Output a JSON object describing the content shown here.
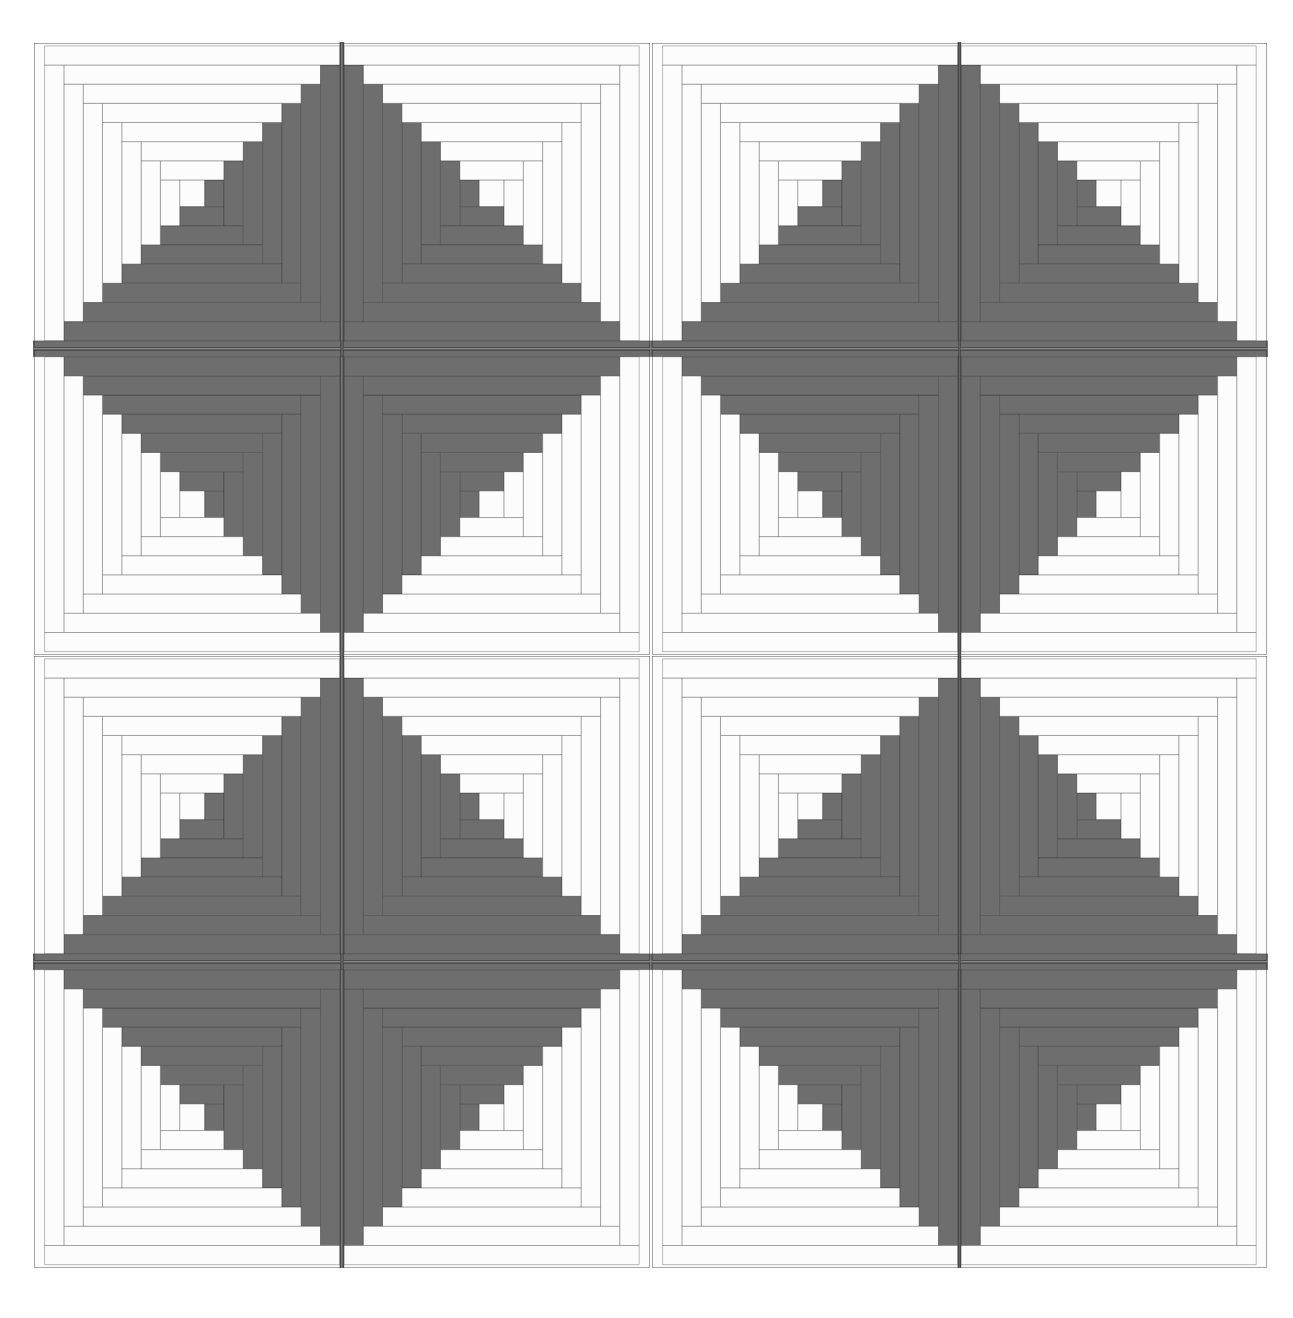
{
  "artwork": {
    "title": "Log Cabin Quilt Pattern",
    "type": "line-drawing",
    "description": "Four-by-four grid of Log Cabin quilt blocks in light and dark halves, rotated so dark corners meet to form diagonal pinwheel groupings."
  },
  "canvas": {
    "width": 1293,
    "height": 1318,
    "background": "#ffffff"
  },
  "quilt": {
    "x": 33,
    "y": 42,
    "width": 1235,
    "height": 1226,
    "rows": 4,
    "cols": 4,
    "block_width": 308.75,
    "block_height": 306.5
  },
  "colors": {
    "light_fabric": "#fcfcfc",
    "dark_fabric": "#6e6e6e",
    "seam_line": "#1b1b1b",
    "background": "#ffffff"
  },
  "block": {
    "unit_grid": 16,
    "logs_per_block": 13,
    "center_square": "light",
    "seam_width_px": 2.4,
    "log_widths_units": [
      1,
      1,
      1,
      1,
      1,
      1,
      1
    ],
    "description": "Each block is built from a small center square with successive L-shaped logs; one diagonal half is light fabric, the opposite half is dark fabric."
  },
  "orientations": {
    "legend": {
      "dark-br": "dark logs occupy bottom and right sides",
      "dark-bl": "dark logs occupy bottom and left sides",
      "dark-tr": "dark logs occupy top and right sides",
      "dark-tl": "dark logs occupy top and left sides"
    },
    "grid": [
      [
        "dark-br",
        "dark-bl",
        "dark-br",
        "dark-bl"
      ],
      [
        "dark-tr",
        "dark-tl",
        "dark-tr",
        "dark-tl"
      ],
      [
        "dark-br",
        "dark-bl",
        "dark-br",
        "dark-bl"
      ],
      [
        "dark-tr",
        "dark-tl",
        "dark-tr",
        "dark-tl"
      ]
    ]
  },
  "blocks": [
    {
      "row": 1,
      "col": 1,
      "name": "block-r1c1",
      "orientation": "dark-br"
    },
    {
      "row": 1,
      "col": 2,
      "name": "block-r1c2",
      "orientation": "dark-bl"
    },
    {
      "row": 1,
      "col": 3,
      "name": "block-r1c3",
      "orientation": "dark-br"
    },
    {
      "row": 1,
      "col": 4,
      "name": "block-r1c4",
      "orientation": "dark-bl"
    },
    {
      "row": 2,
      "col": 1,
      "name": "block-r2c1",
      "orientation": "dark-tr"
    },
    {
      "row": 2,
      "col": 2,
      "name": "block-r2c2",
      "orientation": "dark-tl"
    },
    {
      "row": 2,
      "col": 3,
      "name": "block-r2c3",
      "orientation": "dark-tr"
    },
    {
      "row": 2,
      "col": 4,
      "name": "block-r2c4",
      "orientation": "dark-tl"
    },
    {
      "row": 3,
      "col": 1,
      "name": "block-r3c1",
      "orientation": "dark-br"
    },
    {
      "row": 3,
      "col": 2,
      "name": "block-r3c2",
      "orientation": "dark-bl"
    },
    {
      "row": 3,
      "col": 3,
      "name": "block-r3c3",
      "orientation": "dark-br"
    },
    {
      "row": 3,
      "col": 4,
      "name": "block-r3c4",
      "orientation": "dark-bl"
    },
    {
      "row": 4,
      "col": 1,
      "name": "block-r4c1",
      "orientation": "dark-tr"
    },
    {
      "row": 4,
      "col": 2,
      "name": "block-r4c2",
      "orientation": "dark-tl"
    },
    {
      "row": 4,
      "col": 3,
      "name": "block-r4c3",
      "orientation": "dark-tr"
    },
    {
      "row": 4,
      "col": 4,
      "name": "block-r4c4",
      "orientation": "dark-tl"
    }
  ]
}
